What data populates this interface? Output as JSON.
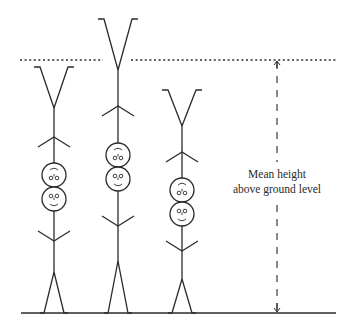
{
  "diagram": {
    "label": {
      "line1": "Mean height",
      "line2": "above ground level"
    },
    "colors": {
      "stroke": "#2b2b2b",
      "background": "#ffffff"
    },
    "mean_line_y": 60,
    "ground_line_y": 313,
    "arrow_x": 277,
    "figures": [
      {
        "name": "figure-left",
        "cx": 54,
        "top": 67,
        "v_join": 108,
        "arm1": 137,
        "head1": 175,
        "head2": 199,
        "arm2": 241,
        "hip": 272
      },
      {
        "name": "figure-middle",
        "cx": 118,
        "top": 19,
        "v_join": 70,
        "arm1": 106,
        "head1": 155,
        "head2": 179,
        "arm2": 226,
        "hip": 261
      },
      {
        "name": "figure-right",
        "cx": 182,
        "top": 90,
        "v_join": 126,
        "arm1": 152,
        "head1": 190,
        "head2": 214,
        "arm2": 251,
        "hip": 279
      }
    ]
  }
}
